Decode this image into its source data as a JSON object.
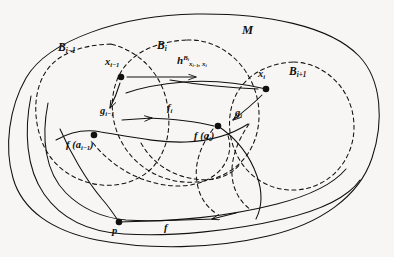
{
  "figure": {
    "kind": "mathematical-diagram",
    "background_color": "#f7f6f4",
    "ink_color": "#111111"
  },
  "regions": [
    {
      "id": "M",
      "label": "M",
      "style": "solid",
      "role": "ambient-manifold"
    },
    {
      "id": "Bim1",
      "label": "B",
      "sub": "i−1",
      "style": "dashed",
      "role": "neighborhood"
    },
    {
      "id": "Bi",
      "label": "B",
      "sub": "i",
      "style": "dashed",
      "role": "neighborhood"
    },
    {
      "id": "Bip1",
      "label": "B",
      "sub": "i+1",
      "style": "dashed",
      "role": "neighborhood"
    }
  ],
  "points": [
    {
      "id": "x_im1",
      "base": "x",
      "sub": "i−1",
      "label": "x_{i-1}",
      "cx": 121,
      "cy": 77
    },
    {
      "id": "x_i",
      "base": "x",
      "sub": "i",
      "label": "x_i",
      "cx": 266,
      "cy": 89
    },
    {
      "id": "fa_im1",
      "base": "f",
      "arg": "a_{i-1}",
      "label": "f (a_{i-1})",
      "cx": 94,
      "cy": 135
    },
    {
      "id": "fa_i",
      "base": "f",
      "arg": "a_i",
      "label": "f (a_i)",
      "cx": 218,
      "cy": 126
    },
    {
      "id": "p",
      "base": "p",
      "sub": "",
      "label": "p",
      "cx": 119,
      "cy": 222
    }
  ],
  "labels": {
    "ambient": "M",
    "region_prev": {
      "base": "B",
      "sub": "i−1"
    },
    "region_cur": {
      "base": "B",
      "sub": "i"
    },
    "region_next": {
      "base": "B",
      "sub": "i+1"
    },
    "point_x_prev": {
      "base": "x",
      "sub": "i−1"
    },
    "point_x_cur": {
      "base": "x",
      "sub": "i"
    },
    "point_p": "p",
    "map_h": {
      "base": "h",
      "sup_base": "B",
      "sup_sub": "i",
      "sub": "x",
      "sub_sub": "i−1",
      "sub_tail": ", x",
      "sub_tail_sub": "i"
    },
    "map_g_prev": {
      "base": "g",
      "sub": "i−1"
    },
    "map_g_cur": {
      "base": "g",
      "sub": "i"
    },
    "map_f_i": {
      "base": "f",
      "sub": "i"
    },
    "map_f": "f",
    "f_of_a_prev": {
      "base": "f",
      "open": "(",
      "arg": "a",
      "arg_sub": "i−1",
      "close": ")"
    },
    "f_of_a_cur": {
      "base": "f",
      "open": "(",
      "arg": "a",
      "arg_sub": "i",
      "close": ")"
    }
  },
  "arrows": [
    {
      "id": "h-arrow",
      "from": "x_im1",
      "to": "x_i",
      "label": "h^{B_i}_{x_{i-1},x_i}",
      "direction": "right"
    },
    {
      "id": "g-prev-arrow",
      "from": "x_im1",
      "to": "fa_im1",
      "label": "g_{i-1}",
      "direction": "down-left"
    },
    {
      "id": "g-cur-arrow",
      "from": "x_i",
      "to": "fa_i",
      "label": "g_i",
      "direction": "down-left"
    },
    {
      "id": "f-i-arrow",
      "from": "fa_im1",
      "to": "fa_i",
      "label": "f_i",
      "direction": "right"
    },
    {
      "id": "f-arrow",
      "from": "right",
      "to": "p",
      "label": "f",
      "direction": "left"
    }
  ]
}
